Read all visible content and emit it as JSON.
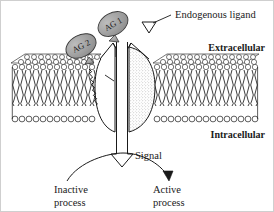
{
  "figure": {
    "background_color": "#ffffff",
    "ink_color": "#1a1a1a",
    "bubble_fill": "#9e9e9e",
    "receptor_fill": "#ffffff",
    "receptor_stipple": "#b5b5b5",
    "membrane_head_fill": "#ffffff",
    "membrane_tail_color": "#1a1a1a"
  },
  "labels": {
    "endogenous_ligand": "Endogenous ligand",
    "extracellular": "Extracellular",
    "intracellular": "Intracellular",
    "signal": "Signal",
    "inactive_process_line1": "Inactive",
    "inactive_process_line2": "process",
    "active_process_line1": "Active",
    "active_process_line2": "process",
    "agonist_1": "AG 1",
    "agonist_2": "AG 2"
  },
  "elements": {
    "ligand_marker": "triangle-down",
    "signal_arrow": "block-arrow-down",
    "outcome_arc": "curved-arrow-right",
    "activation_zigzag": "sawtooth-line",
    "membrane": "lipid-bilayer",
    "receptor": "two-lobe-channel-receptor"
  }
}
